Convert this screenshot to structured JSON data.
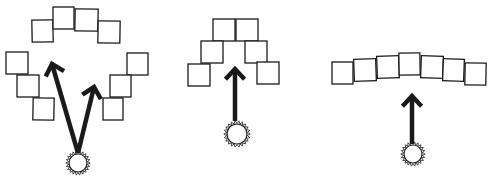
{
  "diagram": {
    "style": "hand-drawn sketch",
    "colors": {
      "stroke": "#1a1a1a",
      "background": "#ffffff",
      "square_fill": "#ffffff"
    },
    "panels": [
      {
        "id": "panel-1",
        "description": "Squares arranged in a large circle-like arc; two arrows from a sun point toward gaps",
        "squares": [
          {
            "x": 32,
            "y": 20,
            "w": 21,
            "h": 22,
            "r": -1
          },
          {
            "x": 53,
            "y": 7,
            "w": 21,
            "h": 22,
            "r": 0
          },
          {
            "x": 75,
            "y": 9,
            "w": 23,
            "h": 22,
            "r": 1
          },
          {
            "x": 98,
            "y": 21,
            "w": 22,
            "h": 22,
            "r": 1
          },
          {
            "x": 6,
            "y": 52,
            "w": 22,
            "h": 22,
            "r": 0
          },
          {
            "x": 17,
            "y": 75,
            "w": 22,
            "h": 22,
            "r": 0
          },
          {
            "x": 33,
            "y": 98,
            "w": 21,
            "h": 22,
            "r": 1
          },
          {
            "x": 127,
            "y": 53,
            "w": 21,
            "h": 22,
            "r": 0
          },
          {
            "x": 110,
            "y": 75,
            "w": 21,
            "h": 22,
            "r": 0
          },
          {
            "x": 103,
            "y": 98,
            "w": 20,
            "h": 22,
            "r": 0
          }
        ],
        "arrows": [
          {
            "x1": 78,
            "y1": 153,
            "x2": 52,
            "y2": 64
          },
          {
            "x1": 78,
            "y1": 153,
            "x2": 94,
            "y2": 87
          }
        ],
        "sun": {
          "cx": 78,
          "cy": 163,
          "r": 9
        }
      },
      {
        "id": "panel-2",
        "description": "Squares arranged in a small arc/pyramid; one arrow from sun pointing up",
        "squares": [
          {
            "x": 213,
            "y": 19,
            "w": 22,
            "h": 22,
            "r": 0
          },
          {
            "x": 236,
            "y": 19,
            "w": 22,
            "h": 22,
            "r": 0
          },
          {
            "x": 201,
            "y": 41,
            "w": 22,
            "h": 22,
            "r": 0
          },
          {
            "x": 245,
            "y": 41,
            "w": 22,
            "h": 22,
            "r": 0
          },
          {
            "x": 188,
            "y": 64,
            "w": 22,
            "h": 22,
            "r": 0
          },
          {
            "x": 257,
            "y": 62,
            "w": 22,
            "h": 22,
            "r": 0
          }
        ],
        "arrows": [
          {
            "x1": 235,
            "y1": 121,
            "x2": 235,
            "y2": 69
          }
        ],
        "sun": {
          "cx": 237,
          "cy": 134,
          "r": 10
        }
      },
      {
        "id": "panel-3",
        "description": "Squares arranged in a shallow arc in a row; one arrow from sun pointing up",
        "squares": [
          {
            "x": 332,
            "y": 62,
            "w": 21,
            "h": 22,
            "r": 0
          },
          {
            "x": 354,
            "y": 59,
            "w": 22,
            "h": 22,
            "r": -2
          },
          {
            "x": 377,
            "y": 56,
            "w": 22,
            "h": 22,
            "r": -2
          },
          {
            "x": 399,
            "y": 53,
            "w": 21,
            "h": 22,
            "r": -1
          },
          {
            "x": 421,
            "y": 56,
            "w": 22,
            "h": 22,
            "r": 2
          },
          {
            "x": 443,
            "y": 59,
            "w": 21,
            "h": 22,
            "r": 2
          },
          {
            "x": 465,
            "y": 63,
            "w": 21,
            "h": 22,
            "r": 1
          }
        ],
        "arrows": [
          {
            "x1": 412,
            "y1": 144,
            "x2": 412,
            "y2": 96
          }
        ],
        "sun": {
          "cx": 413,
          "cy": 154,
          "r": 9
        }
      }
    ]
  }
}
